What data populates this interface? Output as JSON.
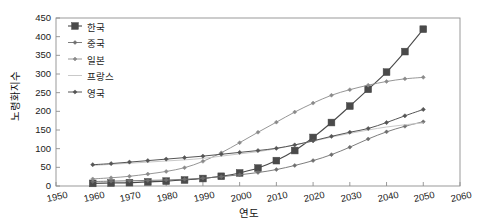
{
  "chart_data": {
    "type": "line",
    "title": "",
    "xlabel": "연도",
    "ylabel": "노령화지수",
    "xlim": [
      1950,
      2060
    ],
    "ylim": [
      0,
      450
    ],
    "xticks": [
      1950,
      1960,
      1970,
      1980,
      1990,
      2000,
      2010,
      2020,
      2030,
      2040,
      2050,
      2060
    ],
    "yticks": [
      0,
      50,
      100,
      150,
      200,
      250,
      300,
      350,
      400,
      450
    ],
    "grid": false,
    "legend_position": "top-left inside",
    "x": [
      1960,
      1965,
      1970,
      1975,
      1980,
      1985,
      1990,
      1995,
      2000,
      2005,
      2010,
      2015,
      2020,
      2025,
      2030,
      2035,
      2040,
      2045,
      2050
    ],
    "series": [
      {
        "name": "한국",
        "color": "#4a4a4a",
        "marker": "square",
        "marker_size": 3.4,
        "line_width": 1.1,
        "values": [
          7,
          8,
          9,
          11,
          13,
          16,
          20,
          26,
          35,
          48,
          68,
          95,
          130,
          170,
          214,
          259,
          305,
          360,
          420
        ]
      },
      {
        "name": "중국",
        "color": "#6e6e6e",
        "marker": "diamond",
        "marker_size": 2.0,
        "line_width": 0.9,
        "values": [
          12,
          13,
          14,
          15,
          16,
          18,
          21,
          25,
          30,
          36,
          44,
          55,
          68,
          84,
          104,
          126,
          145,
          160,
          172
        ]
      },
      {
        "name": "일본",
        "color": "#8a8a8a",
        "marker": "diamond",
        "marker_size": 2.0,
        "line_width": 0.9,
        "values": [
          19,
          22,
          26,
          32,
          39,
          49,
          66,
          89,
          116,
          144,
          171,
          198,
          222,
          243,
          258,
          270,
          280,
          287,
          291
        ]
      },
      {
        "name": "프랑스",
        "color": "#c9c9c9",
        "marker": "none",
        "marker_size": 0,
        "line_width": 1.0,
        "values": [
          55,
          58,
          61,
          64,
          67,
          70,
          74,
          80,
          86,
          92,
          100,
          110,
          120,
          131,
          141,
          150,
          158,
          164,
          169
        ]
      },
      {
        "name": "영국",
        "color": "#555555",
        "marker": "diamond",
        "marker_size": 2.1,
        "line_width": 1.0,
        "values": [
          57,
          60,
          64,
          68,
          72,
          76,
          80,
          85,
          90,
          95,
          101,
          110,
          121,
          133,
          144,
          154,
          170,
          188,
          205
        ]
      }
    ]
  },
  "axes": {
    "ylabel": "노령화지수",
    "xlabel": "연도",
    "ytick_labels": [
      "450",
      "400",
      "350",
      "300",
      "250",
      "200",
      "150",
      "100",
      "50",
      "0"
    ],
    "xtick_labels": [
      "1950",
      "1960",
      "1970",
      "1980",
      "1990",
      "2000",
      "2010",
      "2020",
      "2030",
      "2040",
      "2050",
      "2060"
    ]
  },
  "legend": {
    "items": [
      {
        "label": "한국"
      },
      {
        "label": "중국"
      },
      {
        "label": "일본"
      },
      {
        "label": "프랑스"
      },
      {
        "label": "영국"
      }
    ]
  },
  "style": {
    "axis_color": "#8f8f8f",
    "text_color": "#1a1a1a",
    "background": "#ffffff"
  }
}
